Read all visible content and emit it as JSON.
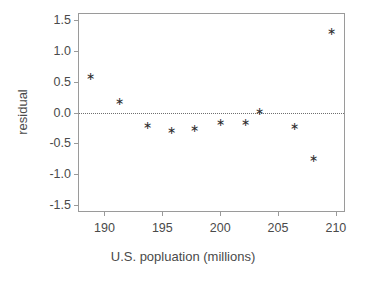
{
  "figure": {
    "background_color": "#ffffff",
    "frame_color": "#9a9a9a",
    "marker_glyph": "∗",
    "marker_color": "#2b2b2b",
    "zero_line_color": "#6f6f6f"
  },
  "chart_data": {
    "type": "scatter",
    "title": "",
    "xlabel": "U.S. popluation (millions)",
    "ylabel": "residual",
    "xlim": [
      187.8,
      210.7
    ],
    "ylim": [
      -1.6,
      1.6
    ],
    "xticks": [
      190,
      195,
      200,
      205,
      210
    ],
    "xtick_labels": [
      "190",
      "195",
      "200",
      "205",
      "210"
    ],
    "yticks": [
      1.5,
      1.0,
      0.5,
      0.0,
      -0.5,
      -1.0,
      -1.5
    ],
    "ytick_labels": [
      "1.5",
      "1.0",
      "0.5",
      "0.0",
      "-0.5",
      "-1.0",
      "-1.5"
    ],
    "grid": false,
    "legend": null,
    "reference_lines": [
      {
        "name": "zero-residual-line",
        "axis": "y",
        "value": 0.0,
        "style": "dotted"
      }
    ],
    "marker": "asterisk",
    "x": [
      188.8,
      191.3,
      193.7,
      195.8,
      197.8,
      200.0,
      202.2,
      203.4,
      206.4,
      208.1,
      209.6
    ],
    "y": [
      0.58,
      0.18,
      -0.21,
      -0.29,
      -0.26,
      -0.16,
      -0.16,
      0.02,
      -0.23,
      -0.74,
      1.31
    ],
    "points": [
      {
        "x": 188.8,
        "y": 0.58
      },
      {
        "x": 191.3,
        "y": 0.18
      },
      {
        "x": 193.7,
        "y": -0.21
      },
      {
        "x": 195.8,
        "y": -0.29
      },
      {
        "x": 197.8,
        "y": -0.26
      },
      {
        "x": 200.0,
        "y": -0.16
      },
      {
        "x": 202.2,
        "y": -0.16
      },
      {
        "x": 203.4,
        "y": 0.02
      },
      {
        "x": 206.4,
        "y": -0.23
      },
      {
        "x": 208.1,
        "y": -0.74
      },
      {
        "x": 209.6,
        "y": 1.31
      }
    ]
  }
}
